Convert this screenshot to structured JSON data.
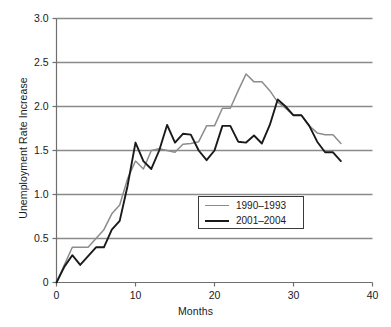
{
  "chart_data": {
    "type": "line",
    "title": "",
    "xlabel": "Months",
    "ylabel": "Unemployment Rate Increase",
    "xlim": [
      0,
      40
    ],
    "ylim": [
      0,
      3.0
    ],
    "xticks": [
      "0",
      "10",
      "20",
      "30",
      "40"
    ],
    "xtick_values": [
      0,
      10,
      20,
      30,
      40
    ],
    "yticks": [
      "0",
      "0.5",
      "1.0",
      "1.5",
      "2.0",
      "2.5",
      "3.0"
    ],
    "ytick_values": [
      0,
      0.5,
      1.0,
      1.5,
      2.0,
      2.5,
      3.0
    ],
    "grid": "horizontal",
    "legend_position": "center-right",
    "series": [
      {
        "name": "1990–1993",
        "color": "#8c8c8c",
        "x": [
          0,
          1,
          2,
          3,
          4,
          5,
          6,
          7,
          8,
          9,
          10,
          11,
          12,
          13,
          14,
          15,
          16,
          17,
          18,
          19,
          20,
          21,
          22,
          23,
          24,
          25,
          26,
          27,
          28,
          29,
          30,
          31,
          32,
          33,
          34,
          35,
          36
        ],
        "values": [
          0.0,
          0.2,
          0.4,
          0.4,
          0.4,
          0.5,
          0.6,
          0.78,
          0.88,
          1.18,
          1.38,
          1.29,
          1.5,
          1.52,
          1.5,
          1.48,
          1.57,
          1.58,
          1.6,
          1.78,
          1.78,
          1.98,
          1.98,
          2.18,
          2.37,
          2.28,
          2.28,
          2.18,
          2.05,
          1.98,
          1.9,
          1.9,
          1.78,
          1.7,
          1.68,
          1.68,
          1.58
        ]
      },
      {
        "name": "2001–2004",
        "color": "#1a1a1a",
        "x": [
          0,
          1,
          2,
          3,
          4,
          5,
          6,
          7,
          8,
          9,
          10,
          11,
          12,
          13,
          14,
          15,
          16,
          17,
          18,
          19,
          20,
          21,
          22,
          23,
          24,
          25,
          26,
          27,
          28,
          29,
          30,
          31,
          32,
          33,
          34,
          35,
          36
        ],
        "values": [
          0.0,
          0.18,
          0.31,
          0.2,
          0.3,
          0.4,
          0.4,
          0.6,
          0.7,
          1.1,
          1.59,
          1.38,
          1.29,
          1.5,
          1.79,
          1.59,
          1.69,
          1.68,
          1.5,
          1.39,
          1.5,
          1.78,
          1.78,
          1.6,
          1.59,
          1.67,
          1.58,
          1.79,
          2.08,
          2.0,
          1.9,
          1.9,
          1.78,
          1.6,
          1.48,
          1.48,
          1.38
        ]
      }
    ]
  },
  "legend": {
    "entries": [
      {
        "label": "1990–1993",
        "color": "#8c8c8c"
      },
      {
        "label": "2001–2004",
        "color": "#1a1a1a"
      }
    ]
  },
  "axes": {
    "y_title": "Unemployment Rate Increase",
    "x_title": "Months"
  },
  "colors": {
    "gridline": "#8a8a8a",
    "axis": "#6f6f6f",
    "series_gray": "#8c8c8c",
    "series_black": "#1a1a1a",
    "background": "#ffffff"
  }
}
